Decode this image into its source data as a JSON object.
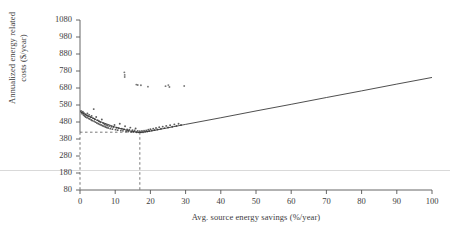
{
  "chart_data": {
    "type": "scatter",
    "title": "",
    "xlabel": "Avg. source energy savings (%/year)",
    "ylabel_line1": "Annualized energy related",
    "ylabel_line2": "costs ($/year)",
    "xlim": [
      0,
      100
    ],
    "ylim": [
      80,
      1080
    ],
    "xticks": [
      0,
      10,
      20,
      30,
      40,
      50,
      60,
      70,
      80,
      90,
      100
    ],
    "yticks": [
      80,
      180,
      280,
      380,
      480,
      580,
      680,
      780,
      880,
      980,
      1080
    ],
    "xtick_labels": [
      "0",
      "10",
      "20",
      "30",
      "40",
      "50",
      "60",
      "70",
      "80",
      "90",
      "100"
    ],
    "ytick_labels": [
      "80",
      "180",
      "280",
      "380",
      "480",
      "580",
      "680",
      "780",
      "880",
      "980",
      "1080"
    ],
    "grid": false,
    "legend": "none",
    "series": [
      {
        "name": "Simulation points",
        "type": "scatter",
        "marker": "dot",
        "color": "#4a4a4a",
        "points": [
          [
            0.3,
            545
          ],
          [
            0.5,
            535
          ],
          [
            0.6,
            528
          ],
          [
            0.8,
            540
          ],
          [
            1.0,
            521
          ],
          [
            1.1,
            533
          ],
          [
            1.3,
            515
          ],
          [
            1.5,
            526
          ],
          [
            1.6,
            509
          ],
          [
            1.8,
            519
          ],
          [
            2.0,
            505
          ],
          [
            2.1,
            530
          ],
          [
            2.3,
            512
          ],
          [
            2.5,
            500
          ],
          [
            2.6,
            522
          ],
          [
            2.8,
            497
          ],
          [
            3.0,
            508
          ],
          [
            3.2,
            492
          ],
          [
            3.3,
            516
          ],
          [
            3.5,
            488
          ],
          [
            3.7,
            503
          ],
          [
            3.9,
            556
          ],
          [
            4.0,
            484
          ],
          [
            4.2,
            498
          ],
          [
            4.4,
            479
          ],
          [
            4.6,
            509
          ],
          [
            4.8,
            474
          ],
          [
            5.0,
            491
          ],
          [
            5.2,
            470
          ],
          [
            5.4,
            484
          ],
          [
            5.6,
            466
          ],
          [
            5.8,
            478
          ],
          [
            6.0,
            462
          ],
          [
            6.2,
            495
          ],
          [
            6.4,
            458
          ],
          [
            6.6,
            472
          ],
          [
            6.8,
            455
          ],
          [
            7.0,
            467
          ],
          [
            7.2,
            451
          ],
          [
            7.4,
            463
          ],
          [
            7.6,
            448
          ],
          [
            7.8,
            459
          ],
          [
            8.0,
            445
          ],
          [
            8.3,
            456
          ],
          [
            8.6,
            441
          ],
          [
            8.9,
            452
          ],
          [
            9.2,
            438
          ],
          [
            9.5,
            449
          ],
          [
            9.8,
            462
          ],
          [
            10.1,
            435
          ],
          [
            10.4,
            446
          ],
          [
            10.7,
            432
          ],
          [
            11.0,
            443
          ],
          [
            11.3,
            470
          ],
          [
            11.6,
            430
          ],
          [
            11.9,
            441
          ],
          [
            12.2,
            428
          ],
          [
            12.5,
            438
          ],
          [
            12.8,
            455
          ],
          [
            13.1,
            426
          ],
          [
            13.4,
            436
          ],
          [
            13.7,
            424
          ],
          [
            14.0,
            434
          ],
          [
            14.3,
            447
          ],
          [
            14.6,
            423
          ],
          [
            14.9,
            432
          ],
          [
            15.2,
            421
          ],
          [
            15.5,
            430
          ],
          [
            15.8,
            442
          ],
          [
            16.1,
            420
          ],
          [
            16.4,
            428
          ],
          [
            16.7,
            419
          ],
          [
            17.0,
            426
          ],
          [
            17.3,
            419
          ],
          [
            17.6,
            427
          ],
          [
            17.9,
            420
          ],
          [
            18.2,
            429
          ],
          [
            18.5,
            422
          ],
          [
            18.8,
            431
          ],
          [
            19.1,
            424
          ],
          [
            19.4,
            434
          ],
          [
            19.7,
            427
          ],
          [
            20.0,
            437
          ],
          [
            20.4,
            430
          ],
          [
            20.8,
            441
          ],
          [
            21.2,
            433
          ],
          [
            21.6,
            445
          ],
          [
            22.0,
            436
          ],
          [
            22.5,
            449
          ],
          [
            23.0,
            440
          ],
          [
            23.5,
            453
          ],
          [
            24.0,
            444
          ],
          [
            24.5,
            457
          ],
          [
            25.0,
            448
          ],
          [
            25.6,
            461
          ],
          [
            26.2,
            452
          ],
          [
            26.8,
            466
          ],
          [
            27.4,
            457
          ],
          [
            28.0,
            470
          ],
          [
            28.7,
            462
          ]
        ]
      },
      {
        "name": "Outlier points",
        "type": "scatter",
        "marker": "dot",
        "color": "#6a6a6a",
        "points": [
          [
            12.6,
            772
          ],
          [
            12.7,
            757
          ],
          [
            12.7,
            745
          ],
          [
            16.0,
            700
          ],
          [
            16.4,
            698
          ],
          [
            17.3,
            696
          ],
          [
            19.3,
            688
          ],
          [
            24.3,
            691
          ],
          [
            25.1,
            697
          ],
          [
            25.4,
            686
          ],
          [
            29.6,
            692
          ]
        ]
      },
      {
        "name": "Fitted cost curve",
        "type": "line",
        "color": "#2f2f2f",
        "points": [
          [
            0,
            541
          ],
          [
            5,
            488
          ],
          [
            10,
            450
          ],
          [
            14,
            428
          ],
          [
            17,
            418
          ],
          [
            20,
            426
          ],
          [
            30,
            466
          ],
          [
            40,
            505
          ],
          [
            50,
            545
          ],
          [
            60,
            584
          ],
          [
            70,
            624
          ],
          [
            80,
            663
          ],
          [
            90,
            703
          ],
          [
            100,
            742
          ]
        ]
      }
    ],
    "annotations": {
      "optimum_x": 17,
      "optimum_y": 420,
      "reference_lines": [
        {
          "name": "optimum-vertical-dashed",
          "orientation": "vertical",
          "value": 17,
          "style": "dashed"
        },
        {
          "name": "optimum-horizontal-dashed",
          "orientation": "horizontal",
          "value": 420,
          "style": "dashed"
        }
      ]
    }
  }
}
